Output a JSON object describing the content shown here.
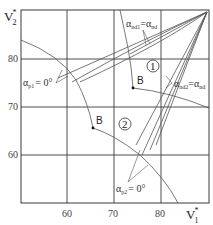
{
  "axes": {
    "x_label": "V",
    "x_label_sub": "1",
    "x_label_sup": "*",
    "y_label": "V",
    "y_label_sub": "2",
    "y_label_sup": "*",
    "x_ticks": [
      "60",
      "70",
      "80"
    ],
    "y_ticks": [
      "80",
      "70",
      "60"
    ]
  },
  "annotations": {
    "alpha_nd1": {
      "symbol": "α",
      "sub1": "nd1",
      "eq": "=",
      "symbol2": "α",
      "sub2": "nd"
    },
    "alpha_nd2": {
      "symbol": "α",
      "sub1": "nd2",
      "eq": "=",
      "symbol2": "α",
      "sub2": "nd"
    },
    "alpha_p1": {
      "symbol": "α",
      "sub": "p1",
      "value": "= 0°"
    },
    "alpha_p2": {
      "symbol": "α",
      "sub": "p2",
      "value": "= 0°"
    }
  },
  "points": {
    "B_upper": "B",
    "B_lower": "B"
  },
  "regions": {
    "region_1": "1",
    "region_2": "2"
  },
  "colors": {
    "line": "#555555",
    "grid": "#3a3a3a",
    "background": "#ffffff"
  }
}
